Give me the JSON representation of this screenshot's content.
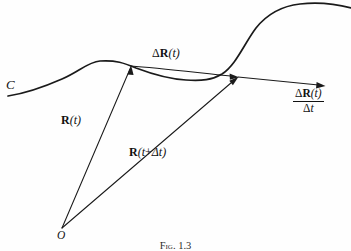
{
  "figure": {
    "type": "vector-calculus-diagram",
    "background_color": "#fefefe",
    "ink_color": "#1a1a1a",
    "caption": "Fig. 1.3"
  },
  "labels": {
    "curve_name": "C",
    "origin": "O",
    "position_vector": {
      "vector": "R",
      "arg_open": "(",
      "arg": "t",
      "arg_close": ")"
    },
    "position_vector_later": {
      "vector": "R",
      "arg_open": "(",
      "arg": "t",
      "plus": "+",
      "delta": "Δt",
      "arg_close": ")"
    },
    "displacement": {
      "delta": "Δ",
      "vector": "R",
      "arg_open": "(",
      "arg": "t",
      "arg_close": ")"
    },
    "derivative": {
      "numerator": {
        "delta": "Δ",
        "vector": "R",
        "arg_open": "(",
        "arg": "t",
        "arg_close": ")"
      },
      "denominator": {
        "delta": "Δ",
        "arg": "t"
      }
    }
  },
  "geometry": {
    "origin_point": [
      62,
      228
    ],
    "point_t": [
      131,
      66
    ],
    "point_t_plus_dt": [
      238,
      77
    ],
    "tangent_arrow_end": [
      325,
      86
    ],
    "curve_path": "M 8,96 C 28,93 46,86 62,79 C 80,71 88,62 100,61 C 116,60 124,63 136,68 C 152,74 168,79 186,80 C 202,81 212,80 222,74 C 236,65 244,44 256,28 C 268,13 282,6 300,4 C 318,2 336,4 351,8",
    "chord_path": "M 131,66 C 160,68 200,73 238,77",
    "vector_rt": [
      [
        62,
        228
      ],
      [
        131,
        66
      ]
    ],
    "vector_rtdt": [
      [
        62,
        228
      ],
      [
        238,
        77
      ]
    ],
    "tangent_ray": [
      [
        238,
        77
      ],
      [
        325,
        86
      ]
    ]
  }
}
